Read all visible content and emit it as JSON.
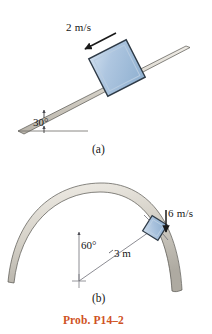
{
  "figure": {
    "caption": "Prob. P14–2",
    "caption_color": "#cf5224",
    "background_color": "#ffffff",
    "parts": [
      {
        "id": "a",
        "label": "(a)",
        "description": "block on inclined plane",
        "annotations": {
          "velocity": "2 m/s",
          "incline_angle": "30°"
        }
      },
      {
        "id": "b",
        "label": "(b)",
        "description": "block on curved dome surface",
        "annotations": {
          "velocity": "6 m/s",
          "angle": "60°",
          "radius": "3 m"
        }
      }
    ]
  },
  "colors": {
    "block_fill": "#a9c3de",
    "block_fill_light": "#c3d6e9",
    "block_edge": "#2d3a46",
    "surface_fill": "#d9d5cd",
    "surface_edge": "#4a4a48",
    "arrow": "#1a1a1a",
    "dimension_line": "#6a6a72",
    "caption": "#cf5224"
  },
  "icons": {
    "velocity_arrow_a": "arrow-down-left-icon",
    "velocity_arrow_b": "arrow-down-icon",
    "angle_marker_a": "angle-marker-icon",
    "center_mark_b": "center-cross-icon"
  }
}
